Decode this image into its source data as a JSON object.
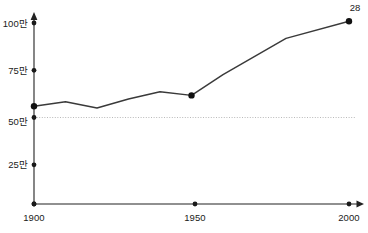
{
  "chart_data": {
    "type": "line",
    "title": "",
    "subtitle": "",
    "xlabel": "",
    "ylabel": "",
    "xlim": [
      1900,
      2000
    ],
    "ylim": [
      0,
      1100000
    ],
    "grid": false,
    "legend": null,
    "y_tick_labels": [
      "25만",
      "50만",
      "75만",
      "100만"
    ],
    "y_tick_values": [
      250000,
      500000,
      750000,
      1000000
    ],
    "x_tick_labels": [
      "1900",
      "1950",
      "2000"
    ],
    "x_tick_values": [
      1900,
      1950,
      2000
    ],
    "reference_line": {
      "value": 500000,
      "label": "50만",
      "style": "dotted"
    },
    "x": [
      1900,
      1910,
      1920,
      1930,
      1940,
      1950,
      1960,
      1980,
      2000
    ],
    "values": [
      540000,
      565000,
      530000,
      580000,
      620000,
      600000,
      715000,
      915000,
      1010000
    ],
    "markers_at": [
      1900,
      1950,
      2000
    ],
    "annotations": [
      {
        "x": 2000,
        "y": 1010000,
        "text": "28"
      }
    ]
  },
  "axes": {
    "y_ticks": [
      {
        "label": "100만",
        "value": 1000000
      },
      {
        "label": "75만",
        "value": 750000
      },
      {
        "label": "50만",
        "value": 500000
      },
      {
        "label": "25만",
        "value": 250000
      }
    ],
    "x_ticks": [
      {
        "label": "1900",
        "value": 1900
      },
      {
        "label": "1950",
        "value": 1950
      },
      {
        "label": "2000",
        "value": 2000
      }
    ]
  },
  "annotation": {
    "end_value_label": "28"
  },
  "colors": {
    "line": "#3a3a3a",
    "marker": "#111111",
    "axis": "#222222",
    "reference": "#b9b9b9",
    "text": "#1a1a1a",
    "background": "#ffffff"
  }
}
